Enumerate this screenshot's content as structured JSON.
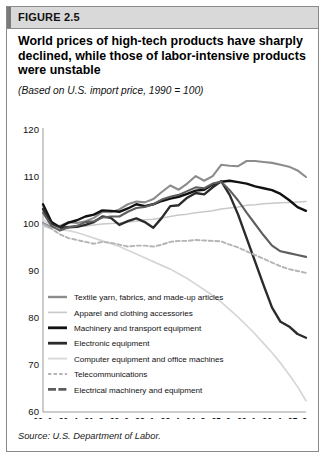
{
  "figure": {
    "label": "FIGURE 2.5",
    "title": "World prices of high-tech products have sharply declined, while those of labor-intensive products were unstable",
    "subtitle": "(Based on U.S. import price, 1990 = 100)",
    "source": "Source: U.S. Department of Labor."
  },
  "chart_data": {
    "type": "line",
    "title": "World prices of high-tech products have sharply declined, while those of labor-intensive products were unstable",
    "subtitle": "(Based on U.S. import price, 1990 = 100)",
    "xlabel": "",
    "ylabel": "",
    "ylim": [
      60,
      120
    ],
    "yticks": [
      60,
      70,
      80,
      90,
      100,
      110,
      120
    ],
    "grid": false,
    "legend_position": "inside-lower-left",
    "x": [
      "90q1",
      "90q2",
      "90q3",
      "90q4",
      "91q1",
      "91q2",
      "91q3",
      "91q4",
      "92q1",
      "92q2",
      "92q3",
      "92q4",
      "93q1",
      "93q2",
      "93q3",
      "93q4",
      "94q1",
      "94q2",
      "94q3",
      "94q4",
      "95q1",
      "95q2",
      "95q3",
      "95q4",
      "96q1",
      "96q2",
      "96q3",
      "96q4",
      "97q1",
      "97q2",
      "97q3",
      "97q4"
    ],
    "xticks": [
      "90q1",
      "90q4",
      "91q3",
      "92q2",
      "93q1",
      "93q4",
      "94q3",
      "95q2",
      "96q1",
      "96q4",
      "97q3"
    ],
    "series": [
      {
        "name": "Textile yarn, fabrics, and made-up articles",
        "color": "#8c8c8c",
        "width": 2.1,
        "dash": "none",
        "values": [
          100.2,
          99.3,
          99.6,
          100.4,
          100.2,
          100.6,
          101.3,
          102.6,
          102.5,
          103.1,
          104.2,
          104.8,
          104.6,
          105.3,
          106.8,
          108.2,
          107.3,
          108.6,
          110.2,
          109.2,
          110.2,
          112.6,
          112.4,
          112.3,
          113.4,
          113.4,
          113.2,
          113.0,
          112.6,
          112.2,
          111.4,
          110.0
        ]
      },
      {
        "name": "Apparel and clothing accessories",
        "color": "#c9c9c9",
        "width": 1.5,
        "dash": "none",
        "values": [
          99.6,
          99.0,
          99.2,
          99.5,
          99.4,
          99.6,
          99.8,
          100.0,
          100.1,
          100.2,
          100.4,
          100.6,
          100.9,
          101.0,
          101.3,
          101.6,
          101.9,
          102.1,
          102.4,
          102.6,
          102.8,
          103.2,
          103.4,
          103.6,
          104.0,
          104.1,
          104.3,
          104.4,
          104.5,
          104.6,
          104.7,
          104.8
        ]
      },
      {
        "name": "Machinery and transport equipment",
        "color": "#111111",
        "width": 2.4,
        "dash": "none",
        "values": [
          104.2,
          100.4,
          99.3,
          100.3,
          100.8,
          101.6,
          102.0,
          102.9,
          102.8,
          102.6,
          103.3,
          104.2,
          103.8,
          104.2,
          104.9,
          105.4,
          105.8,
          106.4,
          107.1,
          107.3,
          108.4,
          109.0,
          109.2,
          108.9,
          108.6,
          108.0,
          107.6,
          107.2,
          106.4,
          105.1,
          103.6,
          102.8
        ]
      },
      {
        "name": "Electronic equipment",
        "color": "#2b2b2b",
        "width": 2.4,
        "dash": "none",
        "values": [
          103.2,
          100.0,
          99.2,
          99.3,
          99.4,
          99.8,
          100.4,
          101.6,
          101.3,
          99.8,
          100.6,
          101.2,
          100.4,
          99.2,
          101.3,
          103.8,
          104.0,
          105.6,
          106.6,
          106.3,
          107.8,
          109.1,
          106.2,
          102.0,
          97.0,
          92.0,
          87.0,
          82.2,
          79.2,
          78.2,
          76.6,
          75.8
        ]
      },
      {
        "name": "Computer equipment and office machines",
        "color": "#d6d6d6",
        "width": 1.7,
        "dash": "none",
        "values": [
          101.0,
          99.6,
          98.8,
          98.6,
          98.2,
          97.6,
          97.0,
          96.4,
          95.8,
          95.2,
          94.4,
          93.6,
          92.8,
          92.0,
          91.2,
          90.4,
          89.4,
          88.4,
          87.2,
          86.0,
          84.8,
          83.4,
          81.8,
          80.2,
          78.4,
          76.6,
          74.6,
          72.6,
          70.4,
          68.0,
          65.4,
          62.4
        ]
      },
      {
        "name": "Telecommunications",
        "color": "#b4b4b4",
        "width": 1.9,
        "dash": "4 2.6",
        "values": [
          100.0,
          99.0,
          97.8,
          97.0,
          96.6,
          96.2,
          95.8,
          96.2,
          96.0,
          95.6,
          95.2,
          95.4,
          95.4,
          95.2,
          95.6,
          96.2,
          96.4,
          96.4,
          96.6,
          96.5,
          96.4,
          96.3,
          95.6,
          95.0,
          94.2,
          93.4,
          92.6,
          91.8,
          91.0,
          90.4,
          90.0,
          89.6
        ]
      },
      {
        "name": "Electrical machinery and equipment",
        "color": "#5e5e5e",
        "width": 2.1,
        "dash": "none",
        "values": [
          102.4,
          99.6,
          98.6,
          99.3,
          99.6,
          100.4,
          100.6,
          101.4,
          101.6,
          101.6,
          102.6,
          103.4,
          103.6,
          104.2,
          105.2,
          105.8,
          106.2,
          107.0,
          107.8,
          107.6,
          108.6,
          109.0,
          107.2,
          105.0,
          102.4,
          100.0,
          97.6,
          95.4,
          94.2,
          93.8,
          93.4,
          93.0
        ]
      }
    ],
    "legend": [
      {
        "label": "Textile yarn, fabrics, and made-up articles",
        "color": "#8c8c8c",
        "width": 2.4,
        "dash": "none"
      },
      {
        "label": "Apparel and clothing accessories",
        "color": "#c9c9c9",
        "width": 1.6,
        "dash": "none"
      },
      {
        "label": "Machinery and transport equipment",
        "color": "#111111",
        "width": 2.8,
        "dash": "none"
      },
      {
        "label": "Electronic equipment",
        "color": "#2b2b2b",
        "width": 2.8,
        "dash": "none"
      },
      {
        "label": "Computer equipment and office machines",
        "color": "#d6d6d6",
        "width": 1.8,
        "dash": "none"
      },
      {
        "label": "Telecommunications",
        "color": "#b4b4b4",
        "width": 2.0,
        "dash": "3.4 2.2"
      },
      {
        "label": "Electrical machinery and equipment",
        "color": "#5e5e5e",
        "width": 2.6,
        "dash": "8 2.4"
      }
    ]
  }
}
